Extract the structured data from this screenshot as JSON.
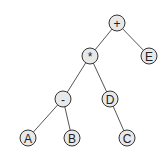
{
  "diagram": {
    "type": "expression-tree",
    "nodes": [
      {
        "id": "plus",
        "label": "+",
        "x": 117,
        "y": 23
      },
      {
        "id": "star",
        "label": "*",
        "x": 90,
        "y": 56
      },
      {
        "id": "E",
        "label": "E",
        "x": 149,
        "y": 56
      },
      {
        "id": "minus",
        "label": "-",
        "x": 63,
        "y": 99
      },
      {
        "id": "D",
        "label": "D",
        "x": 110,
        "y": 99
      },
      {
        "id": "A",
        "label": "A",
        "x": 28,
        "y": 138
      },
      {
        "id": "B",
        "label": "B",
        "x": 72,
        "y": 138
      },
      {
        "id": "C",
        "label": "C",
        "x": 127,
        "y": 138
      }
    ],
    "edges": [
      [
        "plus",
        "star"
      ],
      [
        "plus",
        "E"
      ],
      [
        "star",
        "minus"
      ],
      [
        "star",
        "D"
      ],
      [
        "minus",
        "A"
      ],
      [
        "minus",
        "B"
      ],
      [
        "D",
        "C"
      ]
    ]
  }
}
